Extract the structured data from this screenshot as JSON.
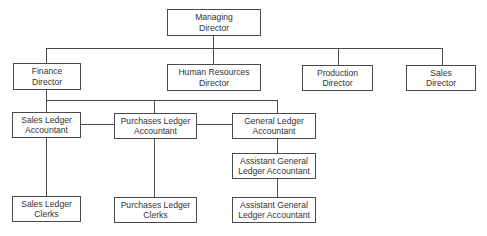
{
  "chart": {
    "title": "",
    "nodes": [
      {
        "id": "md",
        "line1": "Managing",
        "line2": "Director"
      },
      {
        "id": "fd",
        "line1": "Finance",
        "line2": "Director"
      },
      {
        "id": "hr",
        "line1": "Human Resources",
        "line2": "Director"
      },
      {
        "id": "pd",
        "line1": "Production",
        "line2": "Director"
      },
      {
        "id": "sd",
        "line1": "Sales",
        "line2": "Director"
      },
      {
        "id": "sla",
        "line1": "Sales Ledger",
        "line2": "Accountant"
      },
      {
        "id": "pla",
        "line1": "Purchases Ledger",
        "line2": "Accountant"
      },
      {
        "id": "gla",
        "line1": "General Ledger",
        "line2": "Accountant"
      },
      {
        "id": "agla1",
        "line1": "Assistant General",
        "line2": "Ledger Accountant"
      },
      {
        "id": "slc",
        "line1": "Sales Ledger",
        "line2": "Clerks"
      },
      {
        "id": "plc",
        "line1": "Purchases Ledger",
        "line2": "Clerks"
      },
      {
        "id": "agla2",
        "line1": "Assistant General",
        "line2": "Ledger Accountant"
      }
    ],
    "edges": [
      [
        "md",
        "fd"
      ],
      [
        "md",
        "hr"
      ],
      [
        "md",
        "pd"
      ],
      [
        "md",
        "sd"
      ],
      [
        "fd",
        "sla"
      ],
      [
        "fd",
        "pla"
      ],
      [
        "fd",
        "gla"
      ],
      [
        "sla",
        "pla"
      ],
      [
        "pla",
        "gla"
      ],
      [
        "sla",
        "slc"
      ],
      [
        "pla",
        "plc"
      ],
      [
        "gla",
        "agla1"
      ],
      [
        "agla1",
        "agla2"
      ]
    ]
  }
}
